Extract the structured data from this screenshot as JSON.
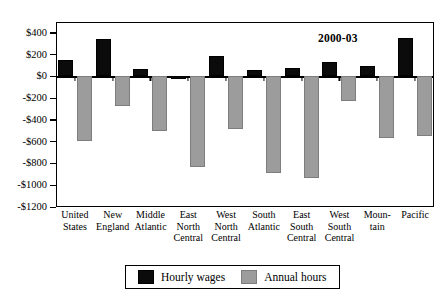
{
  "chart_data": {
    "type": "bar",
    "title": "",
    "annotation": "2000-03",
    "xlabel": "",
    "ylabel": "",
    "ylim": [
      -1200,
      500
    ],
    "grid": false,
    "legend_position": "bottom",
    "ytick_labels": [
      "$400",
      "$200",
      "$0",
      "-$200",
      "-$400",
      "-$600",
      "-$800",
      "-$1000",
      "-$1200"
    ],
    "ytick_values": [
      400,
      200,
      0,
      -200,
      -400,
      -600,
      -800,
      -1000,
      -1200
    ],
    "categories": [
      "United States",
      "New England",
      "Middle Atlantic",
      "East North Central",
      "West North Central",
      "South Atlantic",
      "East South Central",
      "West South Central",
      "Mountain",
      "Pacific"
    ],
    "category_lines": [
      "United\nStates",
      "New\nEngland",
      "Middle\nAtlantic",
      "East\nNorth\nCentral",
      "West\nNorth\nCentral",
      "South\nAtlantic",
      "East\nSouth\nCentral",
      "West\nSouth\nCentral",
      "Moun-\ntain",
      "Pacific"
    ],
    "series": [
      {
        "name": "Hourly wages",
        "color": "#0b0b0b",
        "values": [
          150,
          340,
          70,
          -20,
          190,
          60,
          80,
          130,
          100,
          350
        ]
      },
      {
        "name": "Annual hours",
        "color": "#9c9c9c",
        "values": [
          -590,
          -270,
          -500,
          -830,
          -480,
          -890,
          -930,
          -230,
          -570,
          -550
        ]
      }
    ]
  },
  "legend": {
    "items": [
      {
        "label": "Hourly wages",
        "swatch": "black-square-icon"
      },
      {
        "label": "Annual hours",
        "swatch": "gray-square-icon"
      }
    ]
  }
}
